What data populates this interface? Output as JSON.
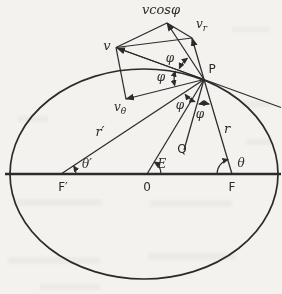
{
  "figure": {
    "type": "ellipse-orbit-velocity-diagram",
    "colors": {
      "ink": "#2b2b2b",
      "background": "#f3f2ef"
    },
    "labels": {
      "p": "P",
      "q": "Q",
      "focus_left": "F′",
      "center": "0",
      "focus_right": "F",
      "r": "r",
      "r_prime": "r′",
      "v": "v",
      "v_r_main": "v",
      "v_r_sub": "r",
      "v_theta_main": "v",
      "v_theta_sub": "θ",
      "v_cos_phi": "vcosφ",
      "phi": "φ",
      "theta": "θ",
      "theta_prime": "θ′",
      "eccentric_anomaly": "E"
    }
  }
}
